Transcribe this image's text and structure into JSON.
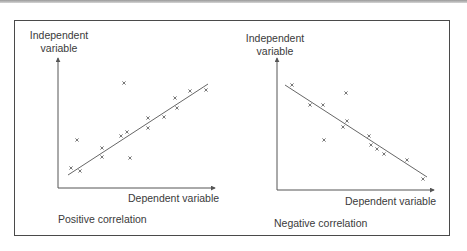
{
  "chart_data": [
    {
      "type": "scatter",
      "title": "Positive correlation",
      "xlabel": "Dependent variable",
      "ylabel": "Independent variable",
      "grid": false,
      "trendline": "increasing",
      "points_px": [
        [
          71,
          168
        ],
        [
          80,
          171
        ],
        [
          77,
          140
        ],
        [
          102,
          148
        ],
        [
          102,
          157
        ],
        [
          121,
          136
        ],
        [
          127,
          132
        ],
        [
          130,
          158
        ],
        [
          124,
          83
        ],
        [
          148,
          118
        ],
        [
          148,
          128
        ],
        [
          164,
          117
        ],
        [
          175,
          98
        ],
        [
          177,
          108
        ],
        [
          190,
          91
        ],
        [
          206,
          90
        ]
      ],
      "trend_px": [
        [
          68,
          175
        ],
        [
          208,
          84
        ]
      ]
    },
    {
      "type": "scatter",
      "title": "Negative correlation",
      "xlabel": "Dependent variable",
      "ylabel": "Independent variable",
      "grid": false,
      "trendline": "decreasing",
      "points_px": [
        [
          292,
          85
        ],
        [
          310,
          105
        ],
        [
          323,
          105
        ],
        [
          346,
          93
        ],
        [
          347,
          121
        ],
        [
          343,
          127
        ],
        [
          324,
          140
        ],
        [
          369,
          136
        ],
        [
          371,
          145
        ],
        [
          377,
          149
        ],
        [
          384,
          154
        ],
        [
          407,
          160
        ],
        [
          423,
          179
        ]
      ],
      "trend_px": [
        [
          285,
          85
        ],
        [
          427,
          177
        ]
      ]
    }
  ],
  "left": {
    "ylabel_line1": "Independent",
    "ylabel_line2": "variable",
    "xlabel": "Dependent variable",
    "caption": "Positive correlation"
  },
  "right": {
    "ylabel_line1": "Independent",
    "ylabel_line2": "variable",
    "xlabel": "Dependent variable",
    "caption": "Negative correlation"
  },
  "colors": {
    "axis": "#555555",
    "marker": "#555555",
    "line": "#555555",
    "text": "#3a3a3a",
    "frame": "#4a4a4a"
  }
}
